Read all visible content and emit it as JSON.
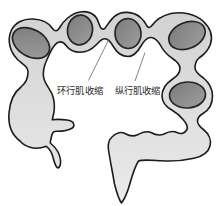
{
  "diagram": {
    "labels": {
      "circular_muscle": "环行肌收缩",
      "longitudinal_muscle": "纵行肌收缩"
    },
    "colors": {
      "background": "#ffffff",
      "body_fill_top": "#d2d2d2",
      "body_fill_bottom": "#eaeaea",
      "body_outline": "#1c1c1c",
      "oval_fill_dark": "#7b7b7b",
      "oval_fill_light": "#9e9e9e",
      "oval_outline": "#262626",
      "leader_line": "#666666",
      "label_text": "#2b2b2b"
    }
  }
}
